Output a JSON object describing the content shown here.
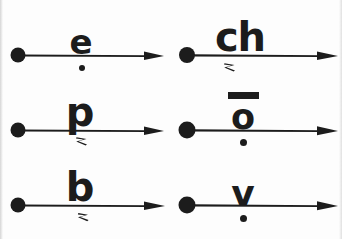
{
  "figure": {
    "width": 342,
    "height": 239,
    "background_color": "#fdfdfd",
    "ink_color": "#1c1c1c",
    "columns": 2,
    "rows": 3
  },
  "cells": [
    {
      "id": "cell-e",
      "row": 1,
      "column": 1,
      "letter": "e",
      "letter_above_line": true,
      "overbar": false,
      "below_mark": "dot",
      "below_mark_name": "dot-below-diacritic",
      "arrow": {
        "tail": "filled-dot",
        "head": "arrowhead-right",
        "direction": "right"
      }
    },
    {
      "id": "cell-ch",
      "row": 1,
      "column": 2,
      "letter": "ch",
      "letter_above_line": true,
      "overbar": false,
      "below_mark": "tick",
      "below_mark_name": "hook-below-diacritic",
      "arrow": {
        "tail": "filled-dot",
        "head": "arrowhead-right",
        "direction": "right"
      }
    },
    {
      "id": "cell-p",
      "row": 2,
      "column": 1,
      "letter": "p",
      "letter_above_line": true,
      "overbar": false,
      "below_mark": "tick",
      "below_mark_name": "hook-below-diacritic",
      "arrow": {
        "tail": "filled-dot",
        "head": "arrowhead-right",
        "direction": "right"
      }
    },
    {
      "id": "cell-o-macron",
      "row": 2,
      "column": 2,
      "letter": "o",
      "letter_above_line": true,
      "overbar": true,
      "overbar_name": "macron-diacritic",
      "below_mark": "dot",
      "below_mark_name": "dot-below-diacritic",
      "arrow": {
        "tail": "filled-dot",
        "head": "arrowhead-right",
        "direction": "right"
      }
    },
    {
      "id": "cell-b",
      "row": 3,
      "column": 1,
      "letter": "b",
      "letter_above_line": true,
      "overbar": false,
      "below_mark": "tick",
      "below_mark_name": "hook-below-diacritic",
      "arrow": {
        "tail": "filled-dot",
        "head": "arrowhead-right",
        "direction": "right"
      }
    },
    {
      "id": "cell-v",
      "row": 3,
      "column": 2,
      "letter": "v",
      "letter_above_line": true,
      "overbar": false,
      "below_mark": "dot",
      "below_mark_name": "dot-below-diacritic",
      "arrow": {
        "tail": "filled-dot",
        "head": "arrowhead-right",
        "direction": "right"
      }
    }
  ]
}
